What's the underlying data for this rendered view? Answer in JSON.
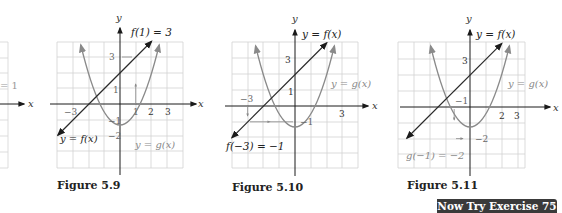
{
  "figures": [
    {
      "id": "partial-left",
      "label_fragment": "= 1",
      "axis_x": "x"
    },
    {
      "id": "5.9",
      "caption": "Figure 5.9",
      "axis_x": "x",
      "axis_y": "y",
      "annotation": "f(1) = 3",
      "line_label": "y = f(x)",
      "parabola_label": "y = g(x)",
      "ticks_x": [
        "−3",
        "1",
        "2",
        "3"
      ],
      "ticks_y": [
        "3",
        "1",
        "−1",
        "−2"
      ]
    },
    {
      "id": "5.10",
      "caption": "Figure 5.10",
      "axis_x": "x",
      "axis_y": "y",
      "annotation": "f(−3) = −1",
      "line_label": "y = f(x)",
      "parabola_label": "y = g(x)",
      "ticks_x": [
        "−3",
        "3"
      ],
      "ticks_y": [
        "3",
        "1",
        "−1"
      ]
    },
    {
      "id": "5.11",
      "caption": "Figure 5.11",
      "axis_x": "x",
      "axis_y": "y",
      "annotation": "g(−1) = −2",
      "line_label": "y = f(x)",
      "parabola_label": "y = g(x)",
      "ticks_x": [
        "−1",
        "2",
        "3"
      ],
      "ticks_y": [
        "3",
        "−2"
      ]
    }
  ],
  "functions": {
    "f": "x + 2",
    "g": "x^2 - 3"
  },
  "colors": {
    "line": "#2a2a2a",
    "parabola": "#8a8a8a",
    "grid": "#cfcfcf",
    "axis": "#1a1a1a",
    "badge_bg": "#3a3a3a",
    "badge_text": "#ffffff"
  },
  "badge": {
    "label": "Now Try Exercise 75"
  }
}
